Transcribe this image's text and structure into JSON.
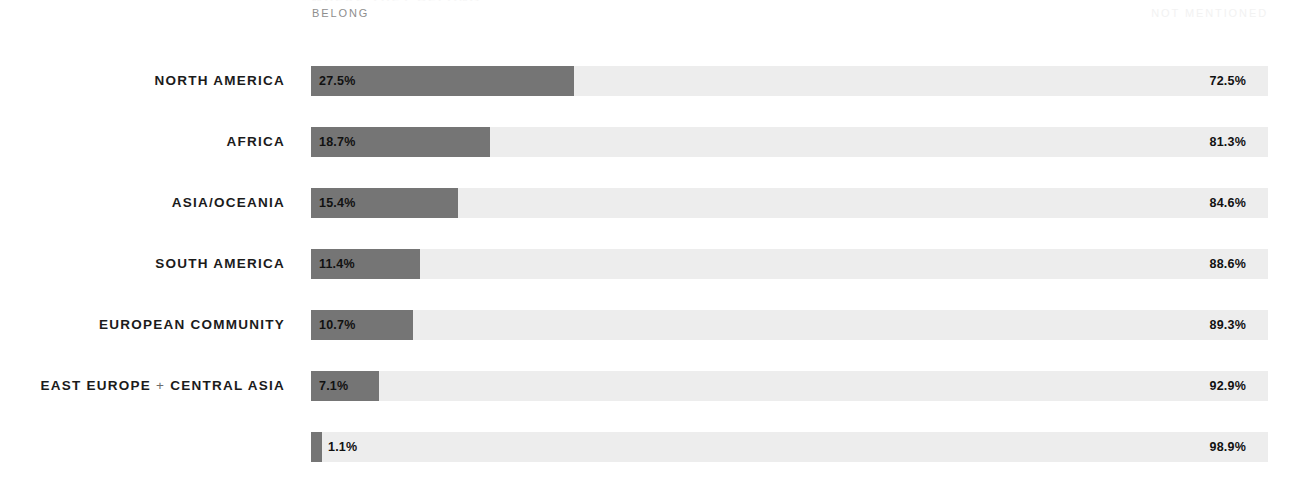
{
  "header": {
    "clipped_title": "WHERE THEY BELONG",
    "legend_left": "BELONG",
    "legend_right": "NOT MENTIONED"
  },
  "colors": {
    "bar_fill": "#757575",
    "bar_track": "#ededed",
    "label_text": "#1b1b1b",
    "legend_left_text": "#8e8e8e",
    "legend_right_text": "#f2f2f2",
    "background": "#ffffff"
  },
  "chart_data": {
    "type": "bar",
    "title": "WHERE THEY BELONG",
    "xlabel": "",
    "ylabel": "",
    "xlim": [
      0,
      100
    ],
    "grid": false,
    "legend_position": "top",
    "orientation": "horizontal",
    "stacked": true,
    "categories": [
      "NORTH AMERICA",
      "AFRICA",
      "ASIA/OCEANIA",
      "SOUTH AMERICA",
      "EUROPEAN COMMUNITY",
      "EAST EUROPE + CENTRAL ASIA",
      ""
    ],
    "series": [
      {
        "name": "BELONG",
        "values": [
          27.5,
          18.7,
          15.4,
          11.4,
          10.7,
          7.1,
          1.1
        ],
        "labels": [
          "27.5%",
          "18.7%",
          "15.4%",
          "11.4%",
          "10.7%",
          "7.1%",
          "1.1%"
        ]
      },
      {
        "name": "NOT MENTIONED",
        "values": [
          72.5,
          81.3,
          84.6,
          88.6,
          89.3,
          92.9,
          98.9
        ],
        "labels": [
          "72.5%",
          "81.3%",
          "84.6%",
          "88.6%",
          "89.3%",
          "92.9%",
          "98.9%"
        ]
      }
    ]
  },
  "rows": [
    {
      "label": "NORTH AMERICA",
      "label_prefix": "",
      "label_suffix": "",
      "has_plus": false,
      "belong_pct": 27.5,
      "belong_text": "27.5%",
      "notmentioned_text": "72.5%",
      "label_outside": false
    },
    {
      "label": "AFRICA",
      "label_prefix": "",
      "label_suffix": "",
      "has_plus": false,
      "belong_pct": 18.7,
      "belong_text": "18.7%",
      "notmentioned_text": "81.3%",
      "label_outside": false
    },
    {
      "label": "ASIA/OCEANIA",
      "label_prefix": "",
      "label_suffix": "",
      "has_plus": false,
      "belong_pct": 15.4,
      "belong_text": "15.4%",
      "notmentioned_text": "84.6%",
      "label_outside": false
    },
    {
      "label": "SOUTH AMERICA",
      "label_prefix": "",
      "label_suffix": "",
      "has_plus": false,
      "belong_pct": 11.4,
      "belong_text": "11.4%",
      "notmentioned_text": "88.6%",
      "label_outside": false
    },
    {
      "label": "EUROPEAN COMMUNITY",
      "label_prefix": "",
      "label_suffix": "",
      "has_plus": false,
      "belong_pct": 10.7,
      "belong_text": "10.7%",
      "notmentioned_text": "89.3%",
      "label_outside": false
    },
    {
      "label": "EAST EUROPE + CENTRAL ASIA",
      "label_prefix": "EAST EUROPE ",
      "label_suffix": " CENTRAL ASIA",
      "has_plus": true,
      "belong_pct": 7.1,
      "belong_text": "7.1%",
      "notmentioned_text": "92.9%",
      "label_outside": false
    },
    {
      "label": "",
      "label_prefix": "",
      "label_suffix": "",
      "has_plus": false,
      "belong_pct": 1.1,
      "belong_text": "1.1%",
      "notmentioned_text": "98.9%",
      "label_outside": true
    }
  ],
  "layout": {
    "track_left": 311,
    "track_width": 957,
    "row_height": 30,
    "row_pitch": 61,
    "first_row_top": 66
  }
}
